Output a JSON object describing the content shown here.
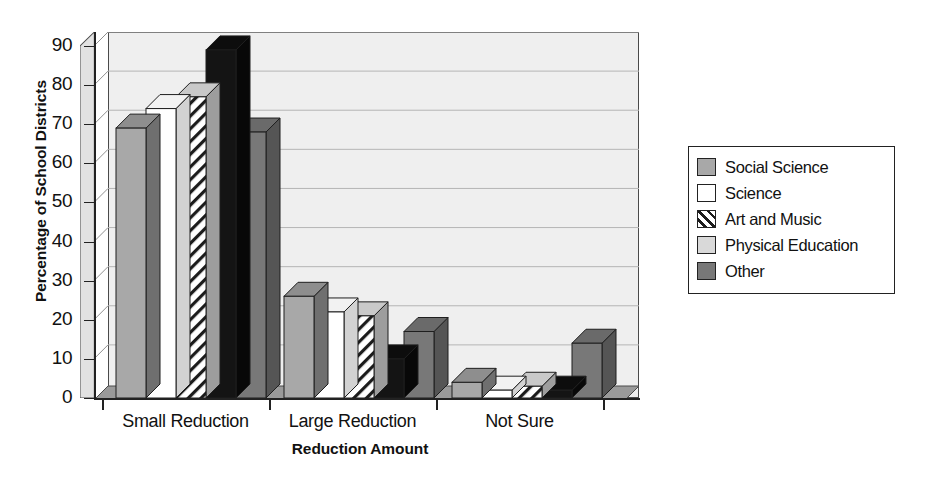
{
  "chart_data": {
    "type": "bar",
    "title": "",
    "subtitle": "",
    "xlabel": "Reduction Amount",
    "ylabel": "Percentage of School Districts",
    "categories": [
      "Small Reduction",
      "Large Reduction",
      "Not Sure"
    ],
    "series": [
      {
        "name": "Social Science",
        "values": [
          69,
          26,
          4
        ],
        "fill": "#a8a8a8",
        "pattern": "solid"
      },
      {
        "name": "Science",
        "values": [
          74,
          22,
          2
        ],
        "fill": "#ffffff",
        "pattern": "solid"
      },
      {
        "name": "Art and Music",
        "values": [
          77,
          21,
          3
        ],
        "fill": "#ffffff",
        "pattern": "diagonal-hatch"
      },
      {
        "name": "Physical Education",
        "values": [
          89,
          10,
          2
        ],
        "fill": "#d9d9d9",
        "pattern": "solid"
      },
      {
        "name": "Other",
        "values": [
          68,
          17,
          14
        ],
        "fill": "#787878",
        "pattern": "solid"
      }
    ],
    "ylim": [
      0,
      90
    ],
    "yticks": [
      0,
      10,
      20,
      30,
      40,
      50,
      60,
      70,
      80,
      90
    ],
    "ytick_labels": [
      "0",
      "10",
      "20",
      "30",
      "40",
      "50",
      "60",
      "70",
      "80",
      "90"
    ],
    "grid": true,
    "grid_axis": "y",
    "legend_position": "right",
    "style": "3d-grouped-column-grayscale",
    "plot_background": "#efefef"
  },
  "legend": {
    "items": [
      {
        "label": "Social Science",
        "swatch": "legend-swatch-social-science"
      },
      {
        "label": "Science",
        "swatch": "legend-swatch-science"
      },
      {
        "label": "Art and Music",
        "swatch": "legend-swatch-art-and-music"
      },
      {
        "label": "Physical Education",
        "swatch": "legend-swatch-physical-education"
      },
      {
        "label": "Other",
        "swatch": "legend-swatch-other"
      }
    ]
  }
}
